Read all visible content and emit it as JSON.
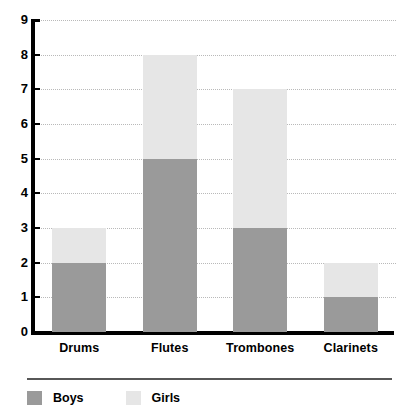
{
  "chart_data": {
    "type": "bar",
    "subtype": "stacked-bar",
    "title": "",
    "xlabel": "",
    "ylabel": "",
    "categories": [
      "Drums",
      "Flutes",
      "Trombones",
      "Clarinets"
    ],
    "series": [
      {
        "name": "Boys",
        "values": [
          2,
          5,
          3,
          1
        ],
        "color": "#9a9a9a"
      },
      {
        "name": "Girls",
        "values": [
          1,
          3,
          4,
          1
        ],
        "color": "#e6e6e6"
      }
    ],
    "totals": [
      3,
      8,
      7,
      2
    ],
    "ylim": [
      0,
      9
    ],
    "ytick_labels": [
      "0",
      "1",
      "2",
      "3",
      "4",
      "5",
      "6",
      "7",
      "8",
      "9"
    ],
    "ytick_values": [
      0,
      1,
      2,
      3,
      4,
      5,
      6,
      7,
      8,
      9
    ],
    "grid": true,
    "grid_style": "dotted",
    "grid_color": "#b9b9b9",
    "legend_position": "bottom-left",
    "axis_color": "#000000"
  },
  "legend": {
    "entries": [
      {
        "label": "Boys",
        "color": "#9a9a9a"
      },
      {
        "label": "Girls",
        "color": "#e6e6e6"
      }
    ]
  },
  "axis": {
    "y_labels": [
      "9",
      "8",
      "7",
      "6",
      "5",
      "4",
      "3",
      "2",
      "1",
      "0"
    ],
    "x_labels": [
      "Drums",
      "Flutes",
      "Trombones",
      "Clarinets"
    ]
  }
}
